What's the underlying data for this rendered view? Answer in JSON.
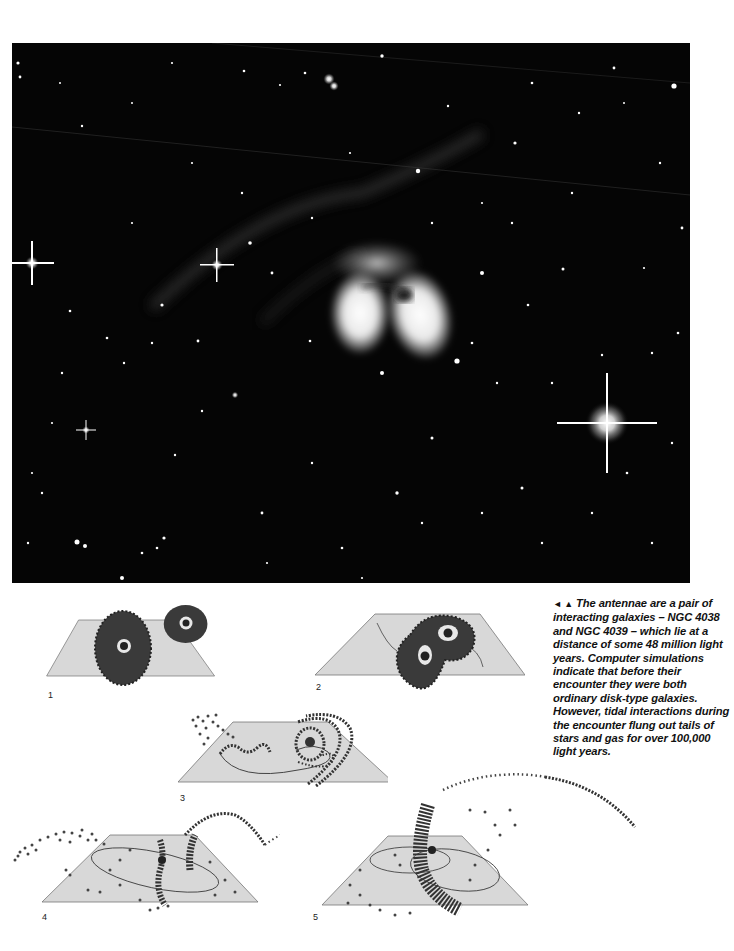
{
  "photo": {
    "subject": "The Antennae interacting galaxies (NGC 4038 / NGC 4039) in a star field",
    "background_color": "#050505"
  },
  "diagrams": {
    "panels": [
      {
        "label": "1",
        "description": "Two separate disk galaxies above a plane"
      },
      {
        "label": "2",
        "description": "Galaxies overlapping at first encounter"
      },
      {
        "label": "3",
        "description": "Tidal streams beginning to form"
      },
      {
        "label": "4",
        "description": "Long tails flung out from both galaxies"
      },
      {
        "label": "5",
        "description": "Merged cores with extended antenna tails"
      }
    ],
    "plane_color": "#d8d8d8",
    "plane_edge_color": "#777777",
    "star_color": "#3a3a3a"
  },
  "caption": {
    "arrows": "◄ ▲",
    "text": "The antennae are a pair of interacting galaxies – NGC 4038 and NGC 4039 – which lie at a distance of some 48 million light years. Computer simulations indicate that before their encounter they were both ordinary disk-type galaxies. However, tidal interactions during the encounter flung out tails of stars and gas for over 100,000 light years."
  }
}
